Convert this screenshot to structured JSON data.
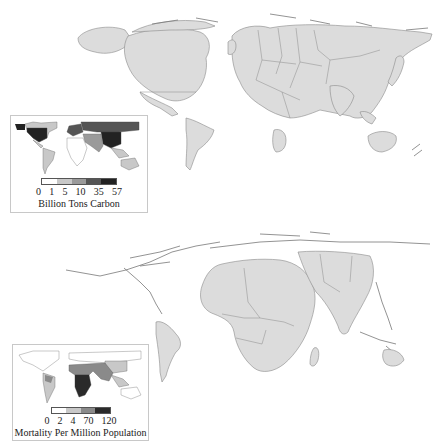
{
  "figure": {
    "panels": [
      {
        "id": "carbon",
        "main_map": "Cartogram of world resized by cumulative carbon emissions",
        "inset": {
          "legend": {
            "title": "Billion Tons Carbon",
            "ticks": [
              "0",
              "1",
              "5",
              "10",
              "35",
              "57"
            ],
            "colors": [
              "#ffffff",
              "#c8c8c8",
              "#9a9a9a",
              "#555555",
              "#222222"
            ]
          }
        }
      },
      {
        "id": "mortality",
        "main_map": "Cartogram of world resized by climate-related mortality",
        "inset": {
          "legend": {
            "title": "Mortality Per Million Population",
            "ticks": [
              "0",
              "2",
              "4",
              "70",
              "120"
            ],
            "colors": [
              "#ffffff",
              "#c8c8c8",
              "#8a8a8a",
              "#2a2a2a"
            ]
          }
        }
      }
    ],
    "colors": {
      "land_fill": "#dcdcdc",
      "land_stroke": "#8a8a8a",
      "background": "#ffffff",
      "inset_border": "#c8c8c8"
    }
  }
}
